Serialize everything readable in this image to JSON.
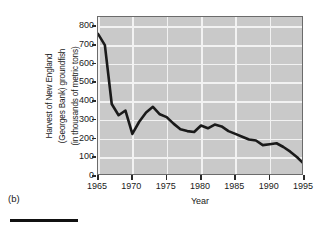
{
  "panel": {
    "letter": "(b)"
  },
  "chart_data": {
    "type": "line",
    "title": "",
    "subtitle": "",
    "xlabel": "Year",
    "ylabel": "Harvest of New England (Georges Bank) groundfish (in thousands of metric tons)",
    "ylabel_lines": [
      "Harvest of New England",
      "(Georges Bank) groundfish",
      "(in thousands of metric tons)"
    ],
    "xlim": [
      1965,
      1995
    ],
    "ylim": [
      0,
      850
    ],
    "yticks": [
      0,
      100,
      200,
      300,
      400,
      500,
      600,
      700,
      800
    ],
    "ytick_labels": [
      "0",
      "100",
      "200",
      "300",
      "400",
      "500",
      "600",
      "700",
      "800"
    ],
    "xticks": [
      1965,
      1970,
      1975,
      1980,
      1985,
      1990,
      1995
    ],
    "xtick_labels": [
      "1965",
      "1970",
      "1975",
      "1980",
      "1985",
      "1990",
      "1995"
    ],
    "grid": true,
    "grid_color": "#f2f2f2",
    "plot_background": "#c9c9c9",
    "line_color": "#1a1a1a",
    "line_width": 2.6,
    "legend": null,
    "annotations": [],
    "x": [
      1965,
      1966,
      1967,
      1968,
      1969,
      1970,
      1971,
      1972,
      1973,
      1974,
      1975,
      1976,
      1977,
      1978,
      1979,
      1980,
      1981,
      1982,
      1983,
      1984,
      1985,
      1986,
      1987,
      1988,
      1989,
      1990,
      1991,
      1992,
      1993,
      1994,
      1995
    ],
    "values": [
      760,
      700,
      385,
      325,
      350,
      225,
      290,
      340,
      370,
      330,
      315,
      280,
      250,
      240,
      235,
      270,
      255,
      275,
      265,
      240,
      225,
      210,
      195,
      190,
      165,
      170,
      175,
      155,
      130,
      100,
      65
    ],
    "series": [
      {
        "name": "New England (Georges Bank) groundfish harvest",
        "values": [
          760,
          700,
          385,
          325,
          350,
          225,
          290,
          340,
          370,
          330,
          315,
          280,
          250,
          240,
          235,
          270,
          255,
          275,
          265,
          240,
          225,
          210,
          195,
          190,
          165,
          170,
          175,
          155,
          130,
          100,
          65
        ]
      }
    ]
  }
}
